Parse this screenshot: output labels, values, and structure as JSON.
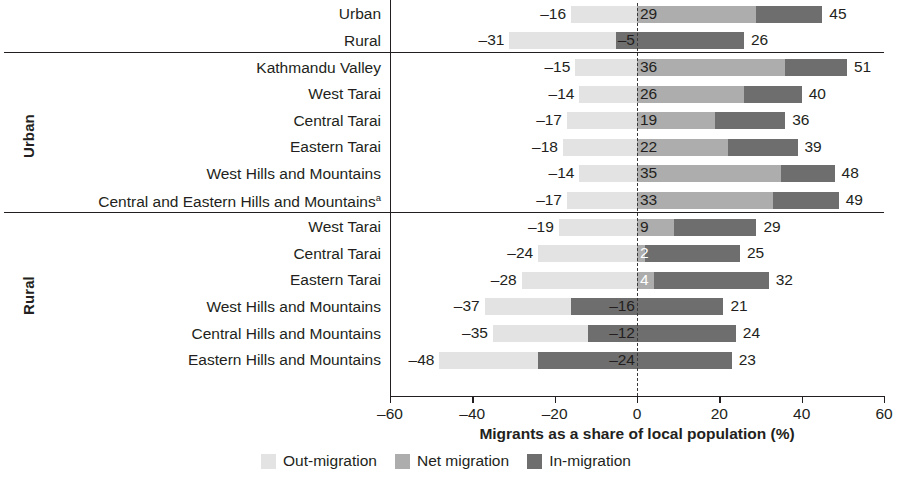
{
  "chart_data": {
    "type": "bar",
    "orientation": "horizontal",
    "title": "",
    "xlabel": "Migrants as a share of local population (%)",
    "ylabel": "",
    "xlim": [
      -60,
      60
    ],
    "xticks": [
      -60,
      -40,
      -20,
      0,
      20,
      40,
      60
    ],
    "xticklabels": [
      "–60",
      "–40",
      "–20",
      "0",
      "20",
      "40",
      "60"
    ],
    "grid": false,
    "zero_reference_line": true,
    "legend_position": "bottom",
    "series": [
      {
        "name": "Out-migration",
        "key": "out",
        "color": "#e3e3e3"
      },
      {
        "name": "Net migration",
        "key": "net",
        "color": "#adadad"
      },
      {
        "name": "In-migration",
        "key": "in",
        "color": "#6e6e6e"
      }
    ],
    "groups": [
      {
        "name": "",
        "rows": [
          {
            "label": "Urban",
            "out": -16,
            "net": 29,
            "in": 45,
            "out_label": "–16",
            "net_label": "29",
            "in_label": "45",
            "net_label_white": false
          },
          {
            "label": "Rural",
            "out": -31,
            "net": -5,
            "in": 26,
            "out_label": "–31",
            "net_label": "–5",
            "in_label": "26",
            "net_label_white": false
          }
        ]
      },
      {
        "name": "Urban",
        "rows": [
          {
            "label": "Kathmandu Valley",
            "out": -15,
            "net": 36,
            "in": 51,
            "out_label": "–15",
            "net_label": "36",
            "in_label": "51",
            "net_label_white": false
          },
          {
            "label": "West Tarai",
            "out": -14,
            "net": 26,
            "in": 40,
            "out_label": "–14",
            "net_label": "26",
            "in_label": "40",
            "net_label_white": false
          },
          {
            "label": "Central Tarai",
            "out": -17,
            "net": 19,
            "in": 36,
            "out_label": "–17",
            "net_label": "19",
            "in_label": "36",
            "net_label_white": false
          },
          {
            "label": "Eastern Tarai",
            "out": -18,
            "net": 22,
            "in": 39,
            "out_label": "–18",
            "net_label": "22",
            "in_label": "39",
            "net_label_white": false
          },
          {
            "label": "West Hills and Mountains",
            "out": -14,
            "net": 35,
            "in": 48,
            "out_label": "–14",
            "net_label": "35",
            "in_label": "48",
            "net_label_white": false
          },
          {
            "label": "Central and Eastern Hills and Mountains",
            "superscript": "a",
            "out": -17,
            "net": 33,
            "in": 49,
            "out_label": "–17",
            "net_label": "33",
            "in_label": "49",
            "net_label_white": false
          }
        ]
      },
      {
        "name": "Rural",
        "rows": [
          {
            "label": "West Tarai",
            "out": -19,
            "net": 9,
            "in": 29,
            "out_label": "–19",
            "net_label": "9",
            "in_label": "29",
            "net_label_white": false
          },
          {
            "label": "Central Tarai",
            "out": -24,
            "net": 2,
            "in": 25,
            "out_label": "–24",
            "net_label": "2",
            "in_label": "25",
            "net_label_white": true
          },
          {
            "label": "Eastern Tarai",
            "out": -28,
            "net": 4,
            "in": 32,
            "out_label": "–28",
            "net_label": "4",
            "in_label": "32",
            "net_label_white": true
          },
          {
            "label": "West Hills and Mountains",
            "out": -37,
            "net": -16,
            "in": 21,
            "out_label": "–37",
            "net_label": "–16",
            "in_label": "21",
            "net_label_white": false
          },
          {
            "label": "Central Hills and Mountains",
            "out": -35,
            "net": -12,
            "in": 24,
            "out_label": "–35",
            "net_label": "–12",
            "in_label": "24",
            "net_label_white": false
          },
          {
            "label": "Eastern Hills and Mountains",
            "out": -48,
            "net": -24,
            "in": 23,
            "out_label": "–48",
            "net_label": "–24",
            "in_label": "23",
            "net_label_white": false
          }
        ]
      }
    ]
  }
}
